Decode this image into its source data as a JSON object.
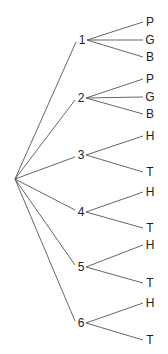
{
  "diagram": {
    "type": "tree-diagram",
    "root": {
      "x": 15,
      "y": 179
    },
    "nodes": [
      {
        "label": "1",
        "x": 82,
        "y": 40,
        "children": [
          {
            "label": "P",
            "x": 150,
            "y": 22
          },
          {
            "label": "G",
            "x": 150,
            "y": 40
          },
          {
            "label": "B",
            "x": 150,
            "y": 57
          }
        ]
      },
      {
        "label": "2",
        "x": 81,
        "y": 98,
        "children": [
          {
            "label": "P",
            "x": 150,
            "y": 79
          },
          {
            "label": "G",
            "x": 150,
            "y": 97
          },
          {
            "label": "B",
            "x": 150,
            "y": 114
          }
        ]
      },
      {
        "label": "3",
        "x": 81,
        "y": 155,
        "children": [
          {
            "label": "H",
            "x": 150,
            "y": 136
          },
          {
            "label": "T",
            "x": 150,
            "y": 172
          }
        ]
      },
      {
        "label": "4",
        "x": 81,
        "y": 212,
        "children": [
          {
            "label": "H",
            "x": 150,
            "y": 192
          },
          {
            "label": "T",
            "x": 150,
            "y": 228
          }
        ]
      },
      {
        "label": "5",
        "x": 81,
        "y": 267,
        "children": [
          {
            "label": "H",
            "x": 150,
            "y": 245
          },
          {
            "label": "T",
            "x": 150,
            "y": 283
          }
        ]
      },
      {
        "label": "6",
        "x": 81,
        "y": 323,
        "children": [
          {
            "label": "H",
            "x": 150,
            "y": 303
          },
          {
            "label": "T",
            "x": 150,
            "y": 340
          }
        ]
      }
    ]
  },
  "colors": {
    "line": "#555555",
    "text": "#222222",
    "background": "#ffffff"
  }
}
